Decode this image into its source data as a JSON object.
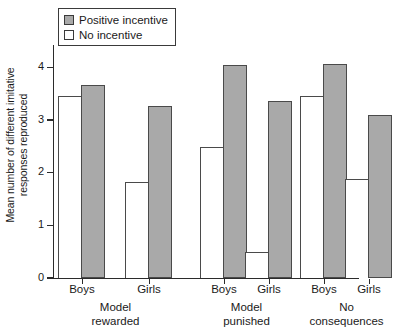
{
  "chart_data": {
    "type": "bar",
    "title": "",
    "xlabel": "",
    "ylabel_line1": "Mean number of different imitative",
    "ylabel_line2": "responses reproduced",
    "ylim": [
      0,
      4.35
    ],
    "yticks": [
      0,
      1,
      2,
      3,
      4
    ],
    "ytick_labels": [
      "0",
      "1",
      "2",
      "3",
      "4"
    ],
    "grid": false,
    "legend_position": "top-left",
    "categories": [
      "Boys",
      "Girls",
      "Boys",
      "Girls",
      "Boys",
      "Girls"
    ],
    "groups": [
      {
        "label_line1": "Model",
        "label_line2": "rewarded",
        "bars": [
          {
            "sex": "Boys",
            "no_incentive": 3.45,
            "positive_incentive": 3.67
          },
          {
            "sex": "Girls",
            "no_incentive": 1.83,
            "positive_incentive": 3.27
          }
        ]
      },
      {
        "label_line1": "Model",
        "label_line2": "punished",
        "bars": [
          {
            "sex": "Boys",
            "no_incentive": 2.48,
            "positive_incentive": 4.05
          },
          {
            "sex": "Girls",
            "no_incentive": 0.5,
            "positive_incentive": 3.36
          }
        ]
      },
      {
        "label_line1": "No",
        "label_line2": "consequences",
        "bars": [
          {
            "sex": "Boys",
            "no_incentive": 3.45,
            "positive_incentive": 4.07
          },
          {
            "sex": "Girls",
            "no_incentive": 1.88,
            "positive_incentive": 3.1
          }
        ]
      }
    ],
    "series": [
      {
        "name": "No incentive",
        "color": "#ffffff",
        "values": [
          3.45,
          1.83,
          2.48,
          0.5,
          3.45,
          1.88
        ]
      },
      {
        "name": "Positive incentive",
        "color": "#a9a9a9",
        "values": [
          3.67,
          3.27,
          4.05,
          3.36,
          4.07,
          3.1
        ]
      }
    ]
  },
  "legend": {
    "items": [
      {
        "label": "Positive incentive",
        "swatch": "gray"
      },
      {
        "label": "No incentive",
        "swatch": "white"
      }
    ]
  },
  "colors": {
    "positive_incentive_fill": "#a9a9a9",
    "no_incentive_fill": "#ffffff",
    "outline": "#4a4a4a",
    "axis": "#2b2b2b"
  }
}
